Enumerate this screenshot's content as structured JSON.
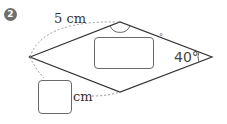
{
  "problem": {
    "number": "2",
    "side_length_label": "5 cm",
    "given_angle_label": "40°",
    "unknown_angle_unit": "°",
    "unknown_length_unit": "cm",
    "unknown_angle_answer": "",
    "unknown_length_answer": ""
  },
  "figure": {
    "shape": "rhombus",
    "icons": {
      "number_marker": "filled-circle-number",
      "angle_marks": [
        "arc-at-top-vertex",
        "arc-at-right-vertex"
      ],
      "dimension_arcs": [
        "dashed-arc-left-to-top",
        "dashed-arc-left-to-bottom"
      ]
    },
    "colors": {
      "outline": "#333333",
      "dashed": "#9a9a9a",
      "marker_fill": "#6e6e6e",
      "answer_box_border": "#6a6a6a"
    }
  }
}
